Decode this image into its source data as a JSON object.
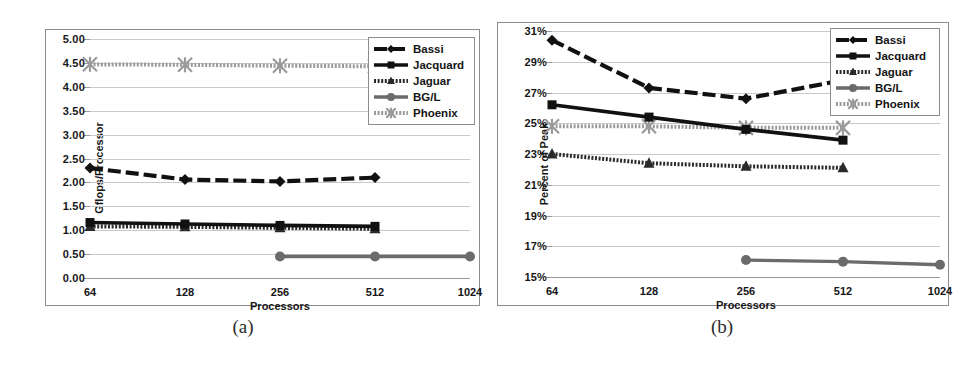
{
  "figure": {
    "subcaptions": [
      {
        "label": "(a)"
      },
      {
        "label": "(b)"
      }
    ]
  },
  "series_colors": {
    "Bassi": "#111111",
    "Jacquard": "#111111",
    "Jaguar": "#2a2a2a",
    "BG/L": "#6b6b6b",
    "Phoenix": "#9a9a9a"
  },
  "chart_data": [
    {
      "type": "line",
      "panel": "a",
      "title": "",
      "xlabel": "Processors",
      "ylabel": "Gflops/Processor",
      "grid": true,
      "legend_position": "top-right",
      "categories": [
        "64",
        "128",
        "256",
        "512",
        "1024"
      ],
      "x": [
        64,
        128,
        256,
        512,
        1024
      ],
      "xscale": "log2",
      "ylim": [
        0.0,
        5.0
      ],
      "ytick_labels": [
        "0.00",
        "0.50",
        "1.00",
        "1.50",
        "2.00",
        "2.50",
        "3.00",
        "3.50",
        "4.00",
        "4.50",
        "5.00"
      ],
      "ytick_values": [
        0.0,
        0.5,
        1.0,
        1.5,
        2.0,
        2.5,
        3.0,
        3.5,
        4.0,
        4.5,
        5.0
      ],
      "series": [
        {
          "name": "Bassi",
          "marker": "diamond",
          "values": [
            2.3,
            2.06,
            2.02,
            2.1,
            null
          ]
        },
        {
          "name": "Jacquard",
          "marker": "square",
          "values": [
            1.16,
            1.13,
            1.1,
            1.08,
            null
          ]
        },
        {
          "name": "Jaguar",
          "marker": "triangle",
          "values": [
            1.08,
            1.07,
            1.05,
            1.03,
            null
          ]
        },
        {
          "name": "BG/L",
          "marker": "circle",
          "values": [
            null,
            null,
            0.45,
            0.45,
            0.45
          ]
        },
        {
          "name": "Phoenix",
          "marker": "asterisk",
          "values": [
            4.47,
            4.46,
            4.44,
            4.43,
            null
          ]
        }
      ]
    },
    {
      "type": "line",
      "panel": "b",
      "title": "",
      "xlabel": "Processors",
      "ylabel": "Percent of Peak",
      "grid": true,
      "legend_position": "top-right",
      "categories": [
        "64",
        "128",
        "256",
        "512",
        "1024"
      ],
      "x": [
        64,
        128,
        256,
        512,
        1024
      ],
      "xscale": "log2",
      "ylim": [
        15,
        31
      ],
      "ytick_labels": [
        "15%",
        "17%",
        "19%",
        "21%",
        "23%",
        "25%",
        "27%",
        "29%",
        "31%"
      ],
      "ytick_values": [
        15,
        17,
        19,
        21,
        23,
        25,
        27,
        29,
        31
      ],
      "series": [
        {
          "name": "Bassi",
          "marker": "diamond",
          "values": [
            30.4,
            27.3,
            26.6,
            27.8,
            null
          ]
        },
        {
          "name": "Jacquard",
          "marker": "square",
          "values": [
            26.2,
            25.4,
            24.6,
            23.9,
            null
          ]
        },
        {
          "name": "Jaguar",
          "marker": "triangle",
          "values": [
            23.0,
            22.4,
            22.2,
            22.1,
            null
          ]
        },
        {
          "name": "BG/L",
          "marker": "circle",
          "values": [
            null,
            null,
            16.1,
            16.0,
            15.8
          ]
        },
        {
          "name": "Phoenix",
          "marker": "asterisk",
          "values": [
            24.8,
            24.8,
            24.7,
            24.7,
            null
          ]
        }
      ]
    }
  ],
  "legend": {
    "entries": [
      {
        "label": "Bassi",
        "marker": "diamond"
      },
      {
        "label": "Jacquard",
        "marker": "square"
      },
      {
        "label": "Jaguar",
        "marker": "triangle"
      },
      {
        "label": "BG/L",
        "marker": "circle"
      },
      {
        "label": "Phoenix",
        "marker": "asterisk"
      }
    ]
  }
}
